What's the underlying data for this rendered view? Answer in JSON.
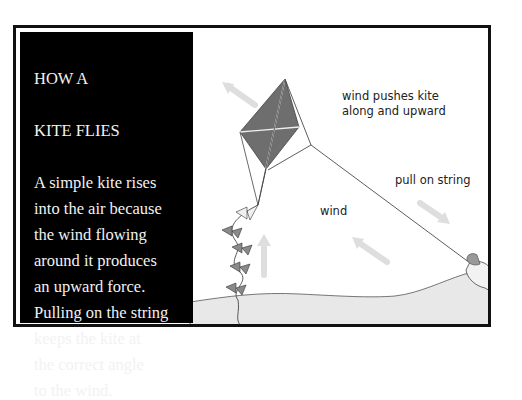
{
  "panel": {
    "title_line1": "HOW A",
    "title_line2": "KITE FLIES",
    "body": "A simple kite rises\ninto the air because\nthe wind flowing\naround it produces\nan upward force.\nPulling on the string\nkeeps the kite at\nthe correct angle\nto the wind."
  },
  "labels": {
    "wind_pushes_line1": "wind pushes kite",
    "wind_pushes_line2": "along and upward",
    "pull_on_string": "pull on string",
    "wind": "wind"
  },
  "colors": {
    "kite": "#6e6e6e",
    "panel_bg": "#000000",
    "frame": "#111111",
    "ground": "#e6e6e6",
    "arrow": "#d4d4d4"
  }
}
